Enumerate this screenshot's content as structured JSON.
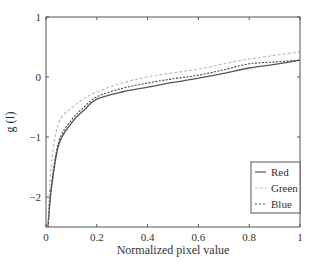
{
  "chart_data": {
    "type": "line",
    "title": "",
    "xlabel": "Normalized pixel value",
    "ylabel": "g (I)",
    "xlim": [
      0,
      1
    ],
    "ylim": [
      -2.5,
      1
    ],
    "xticks": [
      0,
      0.2,
      0.4,
      0.6,
      0.8,
      1
    ],
    "xtick_labels": [
      "0",
      "0.2",
      "0.4",
      "0.6",
      "0.8",
      "1"
    ],
    "yticks": [
      1,
      0,
      -1,
      -2
    ],
    "ytick_labels": [
      "1",
      "0",
      "−1",
      "−2"
    ],
    "grid": false,
    "legend_position": "lower right",
    "x": [
      0.008,
      0.02,
      0.05,
      0.1,
      0.15,
      0.2,
      0.3,
      0.4,
      0.5,
      0.6,
      0.7,
      0.8,
      0.9,
      1.0
    ],
    "series": [
      {
        "name": "Red",
        "style": "solid",
        "color": "#555555",
        "values": [
          -2.5,
          -1.9,
          -1.13,
          -0.77,
          -0.55,
          -0.37,
          -0.25,
          -0.17,
          -0.09,
          -0.02,
          0.06,
          0.15,
          0.21,
          0.28
        ]
      },
      {
        "name": "Green",
        "style": "dashed-light",
        "color": "#bbbbbb",
        "values": [
          -2.5,
          -1.5,
          -0.77,
          -0.52,
          -0.36,
          -0.25,
          -0.1,
          0.0,
          0.07,
          0.13,
          0.22,
          0.3,
          0.36,
          0.42
        ]
      },
      {
        "name": "Blue",
        "style": "dotted-dark",
        "color": "#444444",
        "values": [
          -2.5,
          -1.85,
          -1.08,
          -0.72,
          -0.5,
          -0.33,
          -0.19,
          -0.1,
          -0.03,
          0.03,
          0.12,
          0.22,
          0.25,
          0.28
        ]
      }
    ]
  },
  "legend": {
    "items": [
      {
        "label": "Red"
      },
      {
        "label": "Green"
      },
      {
        "label": "Blue"
      }
    ]
  }
}
